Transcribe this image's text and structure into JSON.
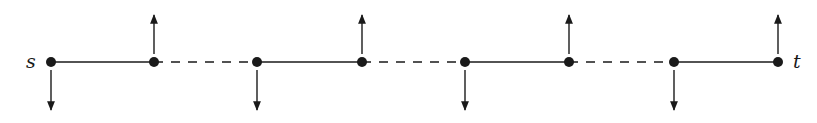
{
  "diagram": {
    "labels": {
      "source": "s",
      "target": "t"
    },
    "colors": {
      "stroke": "#1a1a1a",
      "background": "#ffffff"
    },
    "axis_y": 62,
    "nodes": [
      {
        "id": "n0",
        "x": 51,
        "arrow": "down"
      },
      {
        "id": "n1",
        "x": 154,
        "arrow": "up"
      },
      {
        "id": "n2",
        "x": 257,
        "arrow": "down"
      },
      {
        "id": "n3",
        "x": 362,
        "arrow": "up"
      },
      {
        "id": "n4",
        "x": 465,
        "arrow": "down"
      },
      {
        "id": "n5",
        "x": 569,
        "arrow": "up"
      },
      {
        "id": "n6",
        "x": 674,
        "arrow": "down"
      },
      {
        "id": "n7",
        "x": 778,
        "arrow": "up"
      }
    ],
    "edges": [
      {
        "from": "n0",
        "to": "n1",
        "style": "solid"
      },
      {
        "from": "n1",
        "to": "n2",
        "style": "dashed"
      },
      {
        "from": "n2",
        "to": "n3",
        "style": "solid"
      },
      {
        "from": "n3",
        "to": "n4",
        "style": "dashed"
      },
      {
        "from": "n4",
        "to": "n5",
        "style": "solid"
      },
      {
        "from": "n5",
        "to": "n6",
        "style": "dashed"
      },
      {
        "from": "n6",
        "to": "n7",
        "style": "solid"
      }
    ]
  }
}
